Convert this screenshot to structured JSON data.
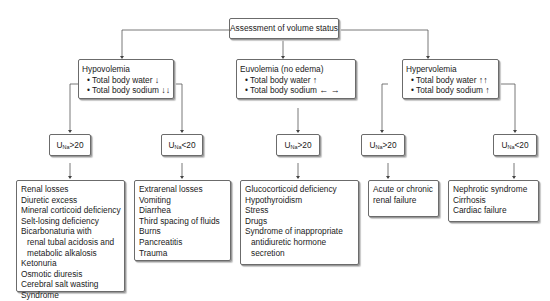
{
  "root": {
    "label": "Assessment of volume status"
  },
  "categories": [
    {
      "title": "Hypovolemia",
      "bullets": [
        {
          "label": "Total body water",
          "arrows": "↓"
        },
        {
          "label": "Total body sodium",
          "arrows": "↓↓"
        }
      ],
      "branches": [
        {
          "criterion": {
            "prefix": "U",
            "sub": "Na",
            "op": ">20"
          },
          "title": "Renal losses",
          "causes": [
            "Diuretic excess",
            "Mineral corticoid deficiency",
            "Selt-losing deficiency",
            "Bicarbonaturia with",
            "  renal tubal acidosis and",
            "  metabolic alkalosis",
            "Ketonuria",
            "Osmotic diuresis",
            "Cerebral salt wasting",
            "Syndrome"
          ]
        },
        {
          "criterion": {
            "prefix": "U",
            "sub": "Na",
            "op": "<20"
          },
          "title": "Extrarenal losses",
          "causes": [
            "Vomiting",
            "Diarrhea",
            "Third spacing of fluids",
            "Burns",
            "Pancreatitis",
            "Trauma"
          ]
        }
      ]
    },
    {
      "title": "Euvolemia (no edema)",
      "bullets": [
        {
          "label": "Total body water",
          "arrows": "↑"
        },
        {
          "label": "Total body sodium",
          "arrows": "← →"
        }
      ],
      "branches": [
        {
          "criterion": {
            "prefix": "U",
            "sub": "Na",
            "op": ">20"
          },
          "title": "Glucocorticoid deficiency",
          "causes": [
            "Hypothyroidism",
            "Stress",
            "Drugs",
            "Syndrome of inappropriate",
            "  antidiuretic hormone",
            "  secretion"
          ]
        }
      ]
    },
    {
      "title": "Hypervolemia",
      "bullets": [
        {
          "label": "Total body water",
          "arrows": "↑↑"
        },
        {
          "label": "Total body sodium",
          "arrows": "↑"
        }
      ],
      "branches": [
        {
          "criterion": {
            "prefix": "U",
            "sub": "Na",
            "op": ">20"
          },
          "title": "Acute or chronic",
          "causes": [
            "renal failure"
          ]
        },
        {
          "criterion": {
            "prefix": "U",
            "sub": "Na",
            "op": "<20"
          },
          "title": "Nephrotic syndrome",
          "causes": [
            "Cirrhosis",
            "Cardiac failure"
          ]
        }
      ]
    }
  ],
  "colors": {
    "border": "#6b6b6b",
    "line": "#555555",
    "text": "#1a1a1a"
  }
}
